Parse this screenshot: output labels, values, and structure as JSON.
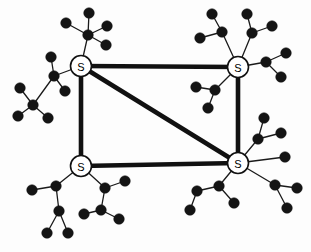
{
  "diagram": {
    "type": "network-topology",
    "width": 311,
    "height": 252,
    "background_color": "#fdfdfd",
    "style": {
      "backbone_color": "#111111",
      "backbone_width": 4.6,
      "access_color": "#1a1a1a",
      "access_width": 1.3,
      "host_color": "#141414",
      "host_radius": 5.3,
      "switch_fill": "#ffffff",
      "switch_stroke": "#111111",
      "switch_stroke_width": 1.6,
      "switch_radius": 10.5,
      "switch_label_size": 11
    },
    "switches": [
      {
        "id": "sw-top-left",
        "label": "S",
        "x": 81,
        "y": 66,
        "name": "switch-top-left"
      },
      {
        "id": "sw-top-right",
        "label": "S",
        "x": 238,
        "y": 67,
        "name": "switch-top-right"
      },
      {
        "id": "sw-bottom-left",
        "label": "S",
        "x": 81,
        "y": 166,
        "name": "switch-bottom-left"
      },
      {
        "id": "sw-bottom-right",
        "label": "S",
        "x": 238,
        "y": 163,
        "name": "switch-bottom-right"
      }
    ],
    "backbone_links": [
      {
        "id": "lnk-top",
        "from": "sw-top-left",
        "to": "sw-top-right",
        "x1": 81,
        "y1": 66,
        "x2": 238,
        "y2": 67,
        "name": "backbone-link-top"
      },
      {
        "id": "lnk-left",
        "from": "sw-top-left",
        "to": "sw-bottom-left",
        "x1": 81,
        "y1": 66,
        "x2": 81,
        "y2": 166,
        "name": "backbone-link-left"
      },
      {
        "id": "lnk-right",
        "from": "sw-top-right",
        "to": "sw-bottom-right",
        "x1": 238,
        "y1": 67,
        "x2": 238,
        "y2": 163,
        "name": "backbone-link-right"
      },
      {
        "id": "lnk-bottom",
        "from": "sw-bottom-left",
        "to": "sw-bottom-right",
        "x1": 81,
        "y1": 166,
        "x2": 238,
        "y2": 163,
        "name": "backbone-link-bottom"
      },
      {
        "id": "lnk-diagonal",
        "from": "sw-top-left",
        "to": "sw-bottom-right",
        "x1": 81,
        "y1": 66,
        "x2": 238,
        "y2": 163,
        "name": "backbone-link-diagonal"
      }
    ],
    "hosts": [
      {
        "id": "h1",
        "x": 88,
        "y": 35,
        "name": "host-node"
      },
      {
        "id": "h2",
        "x": 89,
        "y": 13,
        "name": "host-node"
      },
      {
        "id": "h3",
        "x": 66,
        "y": 23,
        "name": "host-node"
      },
      {
        "id": "h4",
        "x": 107,
        "y": 26,
        "name": "host-node"
      },
      {
        "id": "h5",
        "x": 106,
        "y": 45,
        "name": "host-node"
      },
      {
        "id": "h6",
        "x": 54,
        "y": 76,
        "name": "host-node"
      },
      {
        "id": "h7",
        "x": 51,
        "y": 57,
        "name": "host-node"
      },
      {
        "id": "h8",
        "x": 65,
        "y": 91,
        "name": "host-node"
      },
      {
        "id": "h9",
        "x": 33,
        "y": 105,
        "name": "host-node"
      },
      {
        "id": "h10",
        "x": 20,
        "y": 88,
        "name": "host-node"
      },
      {
        "id": "h11",
        "x": 18,
        "y": 116,
        "name": "host-node"
      },
      {
        "id": "h12",
        "x": 48,
        "y": 118,
        "name": "host-node"
      },
      {
        "id": "h13",
        "x": 222,
        "y": 32,
        "name": "host-node"
      },
      {
        "id": "h14",
        "x": 212,
        "y": 14,
        "name": "host-node"
      },
      {
        "id": "h15",
        "x": 200,
        "y": 38,
        "name": "host-node"
      },
      {
        "id": "h16",
        "x": 252,
        "y": 33,
        "name": "host-node"
      },
      {
        "id": "h17",
        "x": 247,
        "y": 14,
        "name": "host-node"
      },
      {
        "id": "h18",
        "x": 272,
        "y": 26,
        "name": "host-node"
      },
      {
        "id": "h19",
        "x": 266,
        "y": 62,
        "name": "host-node"
      },
      {
        "id": "h20",
        "x": 286,
        "y": 53,
        "name": "host-node"
      },
      {
        "id": "h21",
        "x": 281,
        "y": 77,
        "name": "host-node"
      },
      {
        "id": "h22",
        "x": 215,
        "y": 90,
        "name": "host-node"
      },
      {
        "id": "h23",
        "x": 196,
        "y": 87,
        "name": "host-node"
      },
      {
        "id": "h24",
        "x": 208,
        "y": 108,
        "name": "host-node"
      },
      {
        "id": "h25",
        "x": 56,
        "y": 186,
        "name": "host-node"
      },
      {
        "id": "h26",
        "x": 32,
        "y": 190,
        "name": "host-node"
      },
      {
        "id": "h27",
        "x": 59,
        "y": 211,
        "name": "host-node"
      },
      {
        "id": "h28",
        "x": 47,
        "y": 233,
        "name": "host-node"
      },
      {
        "id": "h29",
        "x": 68,
        "y": 233,
        "name": "host-node"
      },
      {
        "id": "h30",
        "x": 105,
        "y": 188,
        "name": "host-node"
      },
      {
        "id": "h31",
        "x": 125,
        "y": 181,
        "name": "host-node"
      },
      {
        "id": "h32",
        "x": 101,
        "y": 210,
        "name": "host-node"
      },
      {
        "id": "h33",
        "x": 84,
        "y": 214,
        "name": "host-node"
      },
      {
        "id": "h34",
        "x": 119,
        "y": 219,
        "name": "host-node"
      },
      {
        "id": "h35",
        "x": 258,
        "y": 139,
        "name": "host-node"
      },
      {
        "id": "h36",
        "x": 264,
        "y": 118,
        "name": "host-node"
      },
      {
        "id": "h37",
        "x": 281,
        "y": 133,
        "name": "host-node"
      },
      {
        "id": "h38",
        "x": 285,
        "y": 157,
        "name": "host-node"
      },
      {
        "id": "h39",
        "x": 275,
        "y": 185,
        "name": "host-node"
      },
      {
        "id": "h40",
        "x": 297,
        "y": 188,
        "name": "host-node"
      },
      {
        "id": "h41",
        "x": 287,
        "y": 208,
        "name": "host-node"
      },
      {
        "id": "h42",
        "x": 219,
        "y": 186,
        "name": "host-node"
      },
      {
        "id": "h43",
        "x": 197,
        "y": 191,
        "name": "host-node"
      },
      {
        "id": "h44",
        "x": 190,
        "y": 210,
        "name": "host-node"
      },
      {
        "id": "h45",
        "x": 234,
        "y": 203,
        "name": "host-node"
      }
    ],
    "access_links": [
      {
        "from": "sw-top-left",
        "to": "h1",
        "x1": 81,
        "y1": 66,
        "x2": 88,
        "y2": 35
      },
      {
        "from": "h1",
        "to": "h2",
        "x1": 88,
        "y1": 35,
        "x2": 89,
        "y2": 13
      },
      {
        "from": "h1",
        "to": "h3",
        "x1": 88,
        "y1": 35,
        "x2": 66,
        "y2": 23
      },
      {
        "from": "h1",
        "to": "h4",
        "x1": 88,
        "y1": 35,
        "x2": 107,
        "y2": 26
      },
      {
        "from": "h1",
        "to": "h5",
        "x1": 88,
        "y1": 35,
        "x2": 106,
        "y2": 45
      },
      {
        "from": "sw-top-left",
        "to": "h6",
        "x1": 81,
        "y1": 66,
        "x2": 54,
        "y2": 76
      },
      {
        "from": "h6",
        "to": "h7",
        "x1": 54,
        "y1": 76,
        "x2": 51,
        "y2": 57
      },
      {
        "from": "h6",
        "to": "h8",
        "x1": 54,
        "y1": 76,
        "x2": 65,
        "y2": 91
      },
      {
        "from": "h6",
        "to": "h9",
        "x1": 54,
        "y1": 76,
        "x2": 33,
        "y2": 105
      },
      {
        "from": "h9",
        "to": "h10",
        "x1": 33,
        "y1": 105,
        "x2": 20,
        "y2": 88
      },
      {
        "from": "h9",
        "to": "h11",
        "x1": 33,
        "y1": 105,
        "x2": 18,
        "y2": 116
      },
      {
        "from": "h9",
        "to": "h12",
        "x1": 33,
        "y1": 105,
        "x2": 48,
        "y2": 118
      },
      {
        "from": "sw-top-right",
        "to": "h13",
        "x1": 238,
        "y1": 67,
        "x2": 222,
        "y2": 32
      },
      {
        "from": "h13",
        "to": "h14",
        "x1": 222,
        "y1": 32,
        "x2": 212,
        "y2": 14
      },
      {
        "from": "h13",
        "to": "h15",
        "x1": 222,
        "y1": 32,
        "x2": 200,
        "y2": 38
      },
      {
        "from": "sw-top-right",
        "to": "h16",
        "x1": 238,
        "y1": 67,
        "x2": 252,
        "y2": 33
      },
      {
        "from": "h16",
        "to": "h17",
        "x1": 252,
        "y1": 33,
        "x2": 247,
        "y2": 14
      },
      {
        "from": "h16",
        "to": "h18",
        "x1": 252,
        "y1": 33,
        "x2": 272,
        "y2": 26
      },
      {
        "from": "sw-top-right",
        "to": "h19",
        "x1": 238,
        "y1": 67,
        "x2": 266,
        "y2": 62
      },
      {
        "from": "h19",
        "to": "h20",
        "x1": 266,
        "y1": 62,
        "x2": 286,
        "y2": 53
      },
      {
        "from": "h19",
        "to": "h21",
        "x1": 266,
        "y1": 62,
        "x2": 281,
        "y2": 77
      },
      {
        "from": "sw-top-right",
        "to": "h22",
        "x1": 238,
        "y1": 67,
        "x2": 215,
        "y2": 90
      },
      {
        "from": "h22",
        "to": "h23",
        "x1": 215,
        "y1": 90,
        "x2": 196,
        "y2": 87
      },
      {
        "from": "h22",
        "to": "h24",
        "x1": 215,
        "y1": 90,
        "x2": 208,
        "y2": 108
      },
      {
        "from": "sw-bottom-left",
        "to": "h25",
        "x1": 81,
        "y1": 166,
        "x2": 56,
        "y2": 186
      },
      {
        "from": "h25",
        "to": "h26",
        "x1": 56,
        "y1": 186,
        "x2": 32,
        "y2": 190
      },
      {
        "from": "h25",
        "to": "h27",
        "x1": 56,
        "y1": 186,
        "x2": 59,
        "y2": 211
      },
      {
        "from": "h27",
        "to": "h28",
        "x1": 59,
        "y1": 211,
        "x2": 47,
        "y2": 233
      },
      {
        "from": "h27",
        "to": "h29",
        "x1": 59,
        "y1": 211,
        "x2": 68,
        "y2": 233
      },
      {
        "from": "sw-bottom-left",
        "to": "h30",
        "x1": 81,
        "y1": 166,
        "x2": 105,
        "y2": 188
      },
      {
        "from": "h30",
        "to": "h31",
        "x1": 105,
        "y1": 188,
        "x2": 125,
        "y2": 181
      },
      {
        "from": "h30",
        "to": "h32",
        "x1": 105,
        "y1": 188,
        "x2": 101,
        "y2": 210
      },
      {
        "from": "h32",
        "to": "h33",
        "x1": 101,
        "y1": 210,
        "x2": 84,
        "y2": 214
      },
      {
        "from": "h32",
        "to": "h34",
        "x1": 101,
        "y1": 210,
        "x2": 119,
        "y2": 219
      },
      {
        "from": "sw-bottom-right",
        "to": "h35",
        "x1": 238,
        "y1": 163,
        "x2": 258,
        "y2": 139
      },
      {
        "from": "h35",
        "to": "h36",
        "x1": 258,
        "y1": 139,
        "x2": 264,
        "y2": 118
      },
      {
        "from": "h35",
        "to": "h37",
        "x1": 258,
        "y1": 139,
        "x2": 281,
        "y2": 133
      },
      {
        "from": "sw-bottom-right",
        "to": "h38",
        "x1": 238,
        "y1": 163,
        "x2": 285,
        "y2": 157
      },
      {
        "from": "sw-bottom-right",
        "to": "h39",
        "x1": 238,
        "y1": 163,
        "x2": 275,
        "y2": 185
      },
      {
        "from": "h39",
        "to": "h40",
        "x1": 275,
        "y1": 185,
        "x2": 297,
        "y2": 188
      },
      {
        "from": "h39",
        "to": "h41",
        "x1": 275,
        "y1": 185,
        "x2": 287,
        "y2": 208
      },
      {
        "from": "sw-bottom-right",
        "to": "h42",
        "x1": 238,
        "y1": 163,
        "x2": 219,
        "y2": 186
      },
      {
        "from": "h42",
        "to": "h43",
        "x1": 219,
        "y1": 186,
        "x2": 197,
        "y2": 191
      },
      {
        "from": "h43",
        "to": "h44",
        "x1": 197,
        "y1": 191,
        "x2": 190,
        "y2": 210
      },
      {
        "from": "h42",
        "to": "h45",
        "x1": 219,
        "y1": 186,
        "x2": 234,
        "y2": 203
      }
    ]
  }
}
